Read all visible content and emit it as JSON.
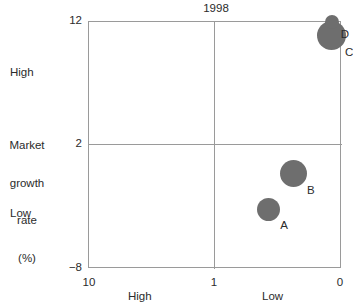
{
  "chart_data": {
    "type": "scatter",
    "title": "1998",
    "xlabel": "",
    "ylabel": "Market growth rate (%)",
    "xlim": [
      10,
      0
    ],
    "ylim": [
      -8,
      12
    ],
    "x_axis": {
      "name": "relative-market-share",
      "ticks": [
        "10",
        "1",
        "0"
      ],
      "tick_values": [
        10,
        1,
        0
      ],
      "qualitative_labels": [
        "High",
        "Low"
      ],
      "reversed": true,
      "divider_at": 1
    },
    "y_axis": {
      "name": "market-growth-rate",
      "title_lines": [
        "Market",
        "growth",
        "rate",
        "(%)"
      ],
      "ticks": [
        "12",
        "2",
        "−8"
      ],
      "tick_values": [
        12,
        2,
        -8
      ],
      "qualitative_labels": [
        "High",
        "Low"
      ],
      "divider_at": 2
    },
    "grid": false,
    "legend": "none",
    "bubble_color": "#6e6e6e",
    "axis_color": "#9a9a9a",
    "points": [
      {
        "label": "A",
        "x": 2.9,
        "y": -3.2,
        "size": 23,
        "quadrant": "high-share-low-growth"
      },
      {
        "label": "B",
        "x": 1.9,
        "y": -0.3,
        "size": 27,
        "quadrant": "high-share-low-growth"
      },
      {
        "label": "C",
        "x": 0.43,
        "y": 10.9,
        "size": 29,
        "quadrant": "low-share-high-growth"
      },
      {
        "label": "D",
        "x": 0.38,
        "y": 12.0,
        "size": 14,
        "quadrant": "low-share-high-growth"
      }
    ]
  }
}
